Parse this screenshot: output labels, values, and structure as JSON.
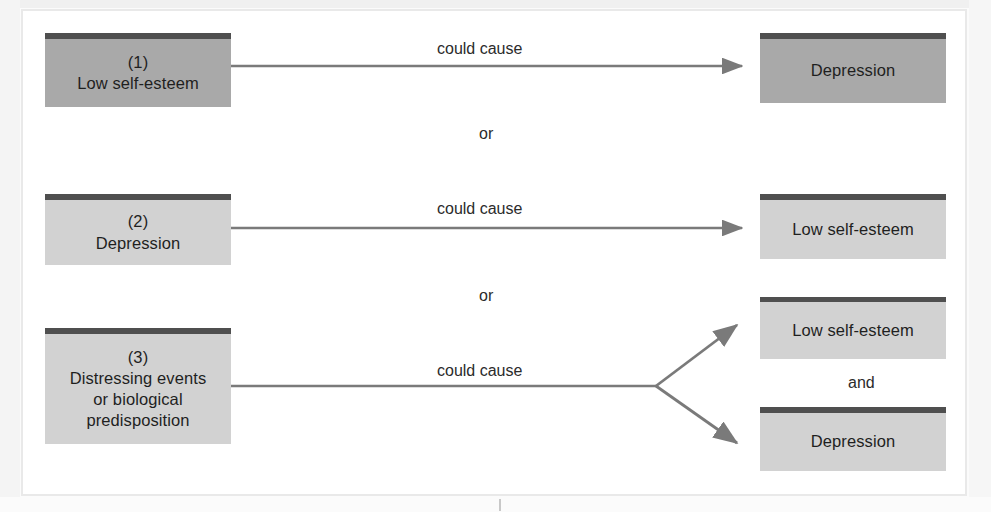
{
  "figure": {
    "type": "causal-direction-diagram",
    "topic": "Possible causal relationships between low self-esteem and depression",
    "connector_label_default": "could cause",
    "alternation_label": "or",
    "conjunction_label": "and",
    "colors": {
      "box_fill_emphasis": "#a9a9a9",
      "box_fill_normal": "#d2d2d2",
      "box_top_bar": "#4f4f4f",
      "arrow": "#7a7a7a",
      "text": "#1f1f1f",
      "frame": "#e9e9e9",
      "page_background": "#ffffff"
    }
  },
  "rows": [
    {
      "id": "row-1",
      "number": "(1)",
      "cause": "Low self-esteem",
      "connector": "could cause",
      "effects": [
        "Depression"
      ],
      "alternation_below": "or"
    },
    {
      "id": "row-2",
      "number": "(2)",
      "cause": "Depression",
      "connector": "could cause",
      "effects": [
        "Low self-esteem"
      ],
      "alternation_below": "or"
    },
    {
      "id": "row-3",
      "number": "(3)",
      "cause_lines": [
        "Distressing events",
        "or biological",
        "predisposition"
      ],
      "cause": "Distressing events or biological predisposition",
      "connector": "could cause",
      "effects": [
        "Low self-esteem",
        "Depression"
      ],
      "effect_joiner": "and"
    }
  ],
  "boxes": {
    "left": [
      {
        "num": "(1)",
        "line1": "Low self-esteem"
      },
      {
        "num": "(2)",
        "line1": "Depression"
      },
      {
        "num": "(3)",
        "line1": "Distressing events",
        "line2": "or biological",
        "line3": "predisposition"
      }
    ],
    "right": [
      {
        "label": "Depression"
      },
      {
        "label": "Low self-esteem"
      },
      {
        "label": "Low self-esteem"
      },
      {
        "label": "Depression"
      }
    ]
  }
}
